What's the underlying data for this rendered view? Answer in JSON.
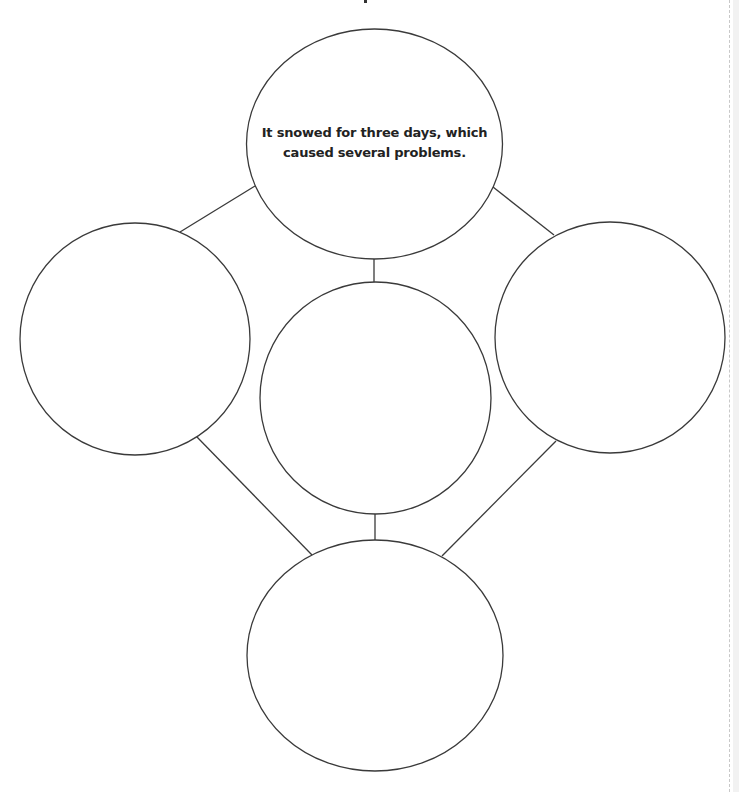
{
  "diagram": {
    "type": "cause-effect web / graphic organizer",
    "main_idea": {
      "line1": "It snowed for three days, which",
      "line2": "caused several problems."
    },
    "nodes": [
      {
        "id": "top",
        "label": "It snowed for three days, which caused several problems.",
        "cx": 374,
        "cy": 144,
        "rx": 128,
        "ry": 115
      },
      {
        "id": "left",
        "label": "",
        "cx": 135,
        "cy": 339,
        "rx": 115,
        "ry": 116
      },
      {
        "id": "center",
        "label": "",
        "cx": 375,
        "cy": 398,
        "rx": 116,
        "ry": 116
      },
      {
        "id": "right",
        "label": "",
        "cx": 610,
        "cy": 338,
        "rx": 115,
        "ry": 116
      },
      {
        "id": "bottom",
        "label": "",
        "cx": 375,
        "cy": 655,
        "rx": 128,
        "ry": 116
      }
    ],
    "edges": [
      {
        "from": "top",
        "to": "left"
      },
      {
        "from": "top",
        "to": "center"
      },
      {
        "from": "top",
        "to": "right"
      },
      {
        "from": "left",
        "to": "bottom"
      },
      {
        "from": "center",
        "to": "bottom"
      },
      {
        "from": "right",
        "to": "bottom"
      }
    ],
    "colors": {
      "stroke": "#3a3a3a",
      "text": "#222222",
      "background": "#ffffff"
    }
  }
}
